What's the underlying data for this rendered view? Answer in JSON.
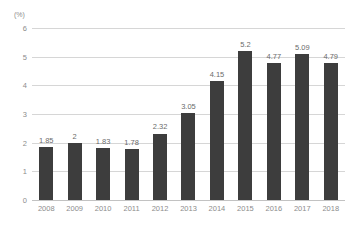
{
  "chart_data": {
    "type": "bar",
    "title": "",
    "xlabel": "",
    "ylabel": "",
    "unit_label": "(%)",
    "categories": [
      "2008",
      "2009",
      "2010",
      "2011",
      "2012",
      "2013",
      "2014",
      "2015",
      "2016",
      "2017",
      "2018"
    ],
    "values": [
      1.85,
      2,
      1.83,
      1.78,
      2.32,
      3.05,
      4.15,
      5.2,
      4.77,
      5.09,
      4.79
    ],
    "value_labels": [
      "1.85",
      "2",
      "1.83",
      "1.78",
      "2.32",
      "3.05",
      "4.15",
      "5.2",
      "4.77",
      "5.09",
      "4.79"
    ],
    "ylim": [
      0,
      6
    ],
    "yticks": [
      0,
      1,
      2,
      3,
      4,
      5,
      6
    ],
    "ytick_labels": [
      "0",
      "1",
      "2",
      "3",
      "4",
      "5",
      "6"
    ],
    "grid": true,
    "legend": false,
    "bar_color": "#3d3d3d",
    "gridline_color": "#d6d6d6",
    "axis_color": "#c2c2c2",
    "label_color": "#8c8c8c",
    "value_label_color": "#6b6b6b",
    "background_color": "#ffffff"
  }
}
